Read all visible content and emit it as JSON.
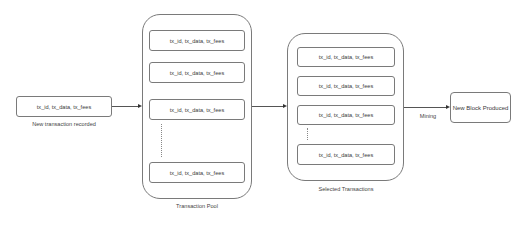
{
  "diagram": {
    "new_transaction": {
      "box_text": "tx_id, tx_data, tx_fees",
      "caption": "New transaction recorded"
    },
    "transaction_pool": {
      "caption": "Transaction Pool",
      "items": [
        "tx_id, tx_data, tx_fees",
        "tx_id, tx_data, tx_fees",
        "tx_id, tx_data, tx_fees",
        "tx_id, tx_data, tx_fees"
      ]
    },
    "selected_transactions": {
      "caption": "Selected Transactions",
      "items": [
        "tx_id, tx_data, tx_fees",
        "tx_id, tx_data, tx_fees",
        "tx_id, tx_data, tx_fees",
        "tx_id, tx_data, tx_fees"
      ]
    },
    "edges": [
      {
        "from": "new_transaction",
        "to": "transaction_pool",
        "label": ""
      },
      {
        "from": "transaction_pool",
        "to": "selected_transactions",
        "label": ""
      },
      {
        "from": "selected_transactions",
        "to": "new_block",
        "label": "Mining"
      }
    ],
    "mining_label": "Mining",
    "new_block": {
      "box_text": "New Block Produced"
    },
    "colors": {
      "stroke": "#7a7a7a",
      "text": "#3a3a3a",
      "background": "#ffffff"
    }
  }
}
